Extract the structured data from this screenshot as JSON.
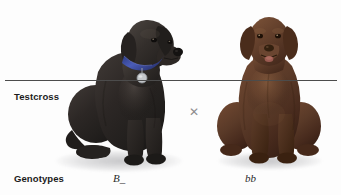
{
  "figure": {
    "background_color": "#fdfdfd",
    "top_clipped_caption": "",
    "divider_color": "#4c4c4c"
  },
  "rows": {
    "testcross_label": "Testcross",
    "genotypes_label": "Genotypes"
  },
  "cross": {
    "symbol": "✕",
    "color": "#8d8d8d"
  },
  "organisms": [
    {
      "id": "black-labrador",
      "common_name": "Black Labrador Retriever",
      "position": "left",
      "genotype": "B_",
      "coat_color_name": "black",
      "coat_color_hex": "#2b2725",
      "accessories": [
        "blue collar",
        "silver id tag"
      ],
      "collar_color_hex": "#3f4f9e",
      "tag_color_hex": "#c3c6c9",
      "pose": "sitting, head turned to the right"
    },
    {
      "id": "chocolate-labrador",
      "common_name": "Chocolate Labrador Retriever",
      "position": "right",
      "genotype": "bb",
      "coat_color_name": "chocolate brown",
      "coat_color_hex": "#5a3a28",
      "accessories": [],
      "tongue_color_hex": "#9c5b52",
      "pose": "sitting, facing forward, tongue out"
    }
  ],
  "icons": {
    "multiplication": "cross-icon"
  }
}
